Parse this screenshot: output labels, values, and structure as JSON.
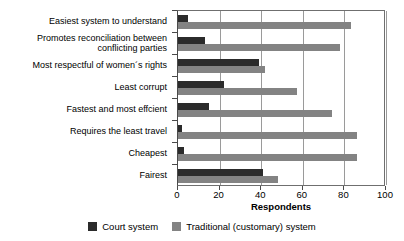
{
  "chart_data": {
    "type": "bar",
    "orientation": "horizontal",
    "title": "",
    "xlabel": "Respondents",
    "ylabel": "",
    "xlim": [
      0,
      100
    ],
    "xticks": [
      0,
      20,
      40,
      60,
      80,
      100
    ],
    "grid": true,
    "legend_position": "bottom",
    "categories": [
      "Easiest system to understand",
      "Promotes reconciliation between\nconflicting parties",
      "Most respectful of women´s rights",
      "Least corrupt",
      "Fastest and most effcient",
      "Requires the least travel",
      "Cheapest",
      "Fairest"
    ],
    "series": [
      {
        "name": "Court system",
        "color": "#2b2b2b",
        "values": [
          5,
          13,
          39,
          22,
          15,
          2,
          3,
          41
        ]
      },
      {
        "name": "Traditional (customary) system",
        "color": "#838383",
        "values": [
          83,
          78,
          42,
          57,
          74,
          86,
          86,
          48
        ]
      }
    ]
  },
  "legend": {
    "items": [
      {
        "label": "Court system",
        "swatch": "court"
      },
      {
        "label": "Traditional (customary) system",
        "swatch": "trad"
      }
    ]
  }
}
